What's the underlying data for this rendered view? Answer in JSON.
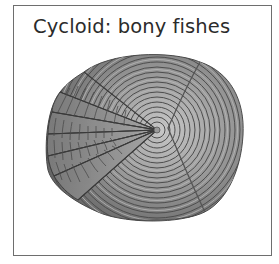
{
  "figure": {
    "title": "Cycloid: bony fishes",
    "colors": {
      "border": "#6e6e6e",
      "title_text": "#2b2b2b",
      "scale_dark": "#4a4a4a",
      "scale_mid": "#8a8a8a",
      "scale_light": "#bdbdbd"
    }
  }
}
